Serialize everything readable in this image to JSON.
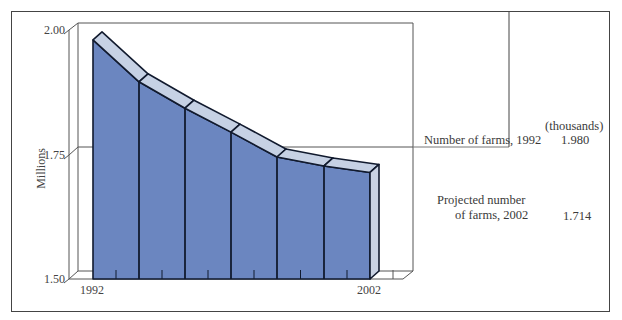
{
  "chart_data": {
    "type": "area",
    "style": "3d-stepped-segments",
    "title": "",
    "xlabel": "",
    "ylabel": "Millions",
    "ylim": [
      1.5,
      2.0
    ],
    "yticks": [
      "1.50",
      "1.75",
      "2.00"
    ],
    "xtick_labels": [
      "1992",
      "2002"
    ],
    "x": [
      1992,
      1993.67,
      1995.33,
      1997,
      1998.67,
      2000.33,
      2002
    ],
    "values": [
      1.98,
      1.896,
      1.843,
      1.795,
      1.745,
      1.727,
      1.714
    ],
    "grid": "single reference line at 1.75",
    "legend": "none"
  },
  "axis": {
    "ylabel": "Millions",
    "y_ticks": {
      "t200": "2.00",
      "t175": "1.75",
      "t150": "1.50"
    },
    "x_ticks": {
      "start": "1992",
      "end": "2002"
    }
  },
  "annotations": {
    "units_header": "(thousands)",
    "farms_1992_label": "Number of farms, 1992",
    "farms_1992_value": "1.980",
    "projected_label_line1": "Projected number",
    "projected_label_line2": "of farms, 2002",
    "projected_value": "1.714"
  },
  "colors": {
    "front_fill": "#6b86c0",
    "top_fill": "#c6d1e4",
    "side_fill": "#c9d2e3",
    "edge": "#111a2e",
    "axis_line": "#555555"
  }
}
